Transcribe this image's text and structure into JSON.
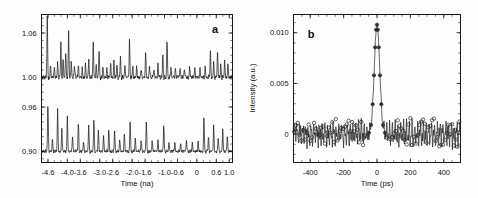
{
  "figure": {
    "panels": [
      {
        "letter": "a",
        "xlabel": "Time (na)",
        "ylabel": "",
        "xticks": [
          "-4.6",
          "-4.0",
          "-3.6",
          "-3.0",
          "-2.6",
          "-2.0",
          "-1.6",
          "-1.0",
          "-0.6",
          "0",
          "0.6",
          "1.0"
        ],
        "yticks": [
          "1.06",
          "1.00",
          "0.96",
          "0.90"
        ]
      },
      {
        "letter": "b",
        "xlabel": "Time (ps)",
        "ylabel": "Intensity (a.u.)",
        "xticks": [
          "-400",
          "-200",
          "0",
          "200",
          "400"
        ],
        "yticks": [
          "0.010",
          "0.005",
          "0"
        ]
      }
    ]
  },
  "chart_data": [
    {
      "type": "line",
      "panel": "a",
      "title": "",
      "xlabel": "Time (na)",
      "ylabel": "",
      "xlim": [
        -4.8,
        1.1
      ],
      "ylim": [
        0.885,
        1.085
      ],
      "xtick_values": [
        -4.6,
        -4.0,
        -3.6,
        -3.0,
        -2.6,
        -2.0,
        -1.6,
        -1.0,
        -0.6,
        0,
        0.6,
        1.0
      ],
      "ytick_values": [
        1.06,
        1.0,
        0.96,
        0.9
      ],
      "grid": false,
      "legend": "none",
      "series": [
        {
          "name": "upper-trace",
          "baseline": 1.0,
          "noise_amplitude": 0.004,
          "description": "Noisy baseline at 1.00 with sharp upward spikes",
          "peaks": [
            {
              "x": -4.62,
              "height": 0.082
            },
            {
              "x": -4.52,
              "height": 0.016
            },
            {
              "x": -4.4,
              "height": 0.012
            },
            {
              "x": -4.3,
              "height": 0.02
            },
            {
              "x": -4.2,
              "height": 0.047
            },
            {
              "x": -4.13,
              "height": 0.024
            },
            {
              "x": -4.05,
              "height": 0.037
            },
            {
              "x": -3.96,
              "height": 0.062
            },
            {
              "x": -3.88,
              "height": 0.023
            },
            {
              "x": -3.78,
              "height": 0.016
            },
            {
              "x": -3.66,
              "height": 0.018
            },
            {
              "x": -3.54,
              "height": 0.013
            },
            {
              "x": -3.44,
              "height": 0.02
            },
            {
              "x": -3.34,
              "height": 0.026
            },
            {
              "x": -3.2,
              "height": 0.048
            },
            {
              "x": -3.11,
              "height": 0.017
            },
            {
              "x": -3.02,
              "height": 0.036
            },
            {
              "x": -2.9,
              "height": 0.014
            },
            {
              "x": -2.78,
              "height": 0.012
            },
            {
              "x": -2.66,
              "height": 0.019
            },
            {
              "x": -2.56,
              "height": 0.024
            },
            {
              "x": -2.47,
              "height": 0.018
            },
            {
              "x": -2.36,
              "height": 0.028
            },
            {
              "x": -2.22,
              "height": 0.015
            },
            {
              "x": -2.08,
              "height": 0.052
            },
            {
              "x": -1.98,
              "height": 0.017
            },
            {
              "x": -1.86,
              "height": 0.014
            },
            {
              "x": -1.72,
              "height": 0.011
            },
            {
              "x": -1.58,
              "height": 0.035
            },
            {
              "x": -1.46,
              "height": 0.016
            },
            {
              "x": -1.33,
              "height": 0.012
            },
            {
              "x": -1.2,
              "height": 0.022
            },
            {
              "x": -1.05,
              "height": 0.03
            },
            {
              "x": -0.92,
              "height": 0.054
            },
            {
              "x": -0.8,
              "height": 0.014
            },
            {
              "x": -0.66,
              "height": 0.011
            },
            {
              "x": -0.52,
              "height": 0.013
            },
            {
              "x": -0.38,
              "height": 0.012
            },
            {
              "x": -0.22,
              "height": 0.015
            },
            {
              "x": -0.06,
              "height": 0.013
            },
            {
              "x": 0.1,
              "height": 0.012
            },
            {
              "x": 0.26,
              "height": 0.014
            },
            {
              "x": 0.42,
              "height": 0.036
            },
            {
              "x": 0.52,
              "height": 0.02
            },
            {
              "x": 0.64,
              "height": 0.038
            },
            {
              "x": 0.74,
              "height": 0.018
            },
            {
              "x": 0.86,
              "height": 0.024
            },
            {
              "x": 0.96,
              "height": 0.02
            }
          ]
        },
        {
          "name": "lower-trace",
          "baseline": 0.9,
          "noise_amplitude": 0.003,
          "description": "Noisy baseline at 0.90 with regularly spaced taller spikes",
          "peaks": [
            {
              "x": -4.6,
              "height": 0.068
            },
            {
              "x": -4.46,
              "height": 0.018
            },
            {
              "x": -4.3,
              "height": 0.058
            },
            {
              "x": -4.17,
              "height": 0.032
            },
            {
              "x": -4.0,
              "height": 0.049
            },
            {
              "x": -3.84,
              "height": 0.021
            },
            {
              "x": -3.66,
              "height": 0.044
            },
            {
              "x": -3.5,
              "height": 0.014
            },
            {
              "x": -3.34,
              "height": 0.036
            },
            {
              "x": -3.18,
              "height": 0.046
            },
            {
              "x": -3.04,
              "height": 0.03
            },
            {
              "x": -2.88,
              "height": 0.022
            },
            {
              "x": -2.72,
              "height": 0.033
            },
            {
              "x": -2.54,
              "height": 0.029
            },
            {
              "x": -2.38,
              "height": 0.016
            },
            {
              "x": -2.24,
              "height": 0.026
            },
            {
              "x": -2.06,
              "height": 0.047
            },
            {
              "x": -1.9,
              "height": 0.02
            },
            {
              "x": -1.72,
              "height": 0.016
            },
            {
              "x": -1.56,
              "height": 0.042
            },
            {
              "x": -1.38,
              "height": 0.015
            },
            {
              "x": -1.2,
              "height": 0.018
            },
            {
              "x": -1.02,
              "height": 0.04
            },
            {
              "x": -0.86,
              "height": 0.014
            },
            {
              "x": -0.68,
              "height": 0.013
            },
            {
              "x": -0.5,
              "height": 0.012
            },
            {
              "x": -0.32,
              "height": 0.016
            },
            {
              "x": -0.14,
              "height": 0.012
            },
            {
              "x": 0.04,
              "height": 0.015
            },
            {
              "x": 0.22,
              "height": 0.048
            },
            {
              "x": 0.36,
              "height": 0.02
            },
            {
              "x": 0.52,
              "height": 0.035
            },
            {
              "x": 0.66,
              "height": 0.018
            },
            {
              "x": 0.8,
              "height": 0.03
            },
            {
              "x": 0.94,
              "height": 0.022
            }
          ]
        }
      ]
    },
    {
      "type": "scatter",
      "panel": "b",
      "title": "",
      "xlabel": "Time (ps)",
      "ylabel": "Intensity (a.u.)",
      "xlim": [
        -500,
        500
      ],
      "ylim": [
        -0.0028,
        0.0118
      ],
      "xtick_values": [
        -400,
        -200,
        0,
        200,
        400
      ],
      "ytick_values": [
        0.01,
        0.005,
        0
      ],
      "grid": false,
      "legend": "none",
      "peak": {
        "center_ps": 0,
        "amplitude": 0.0108,
        "fwhm_ps": 38
      },
      "noise_amplitude": 0.0011,
      "series": [
        {
          "name": "autocorrelation-fit",
          "style": "line"
        },
        {
          "name": "measured-points",
          "style": "open-circles"
        },
        {
          "name": "peak-points",
          "style": "filled-circles"
        }
      ]
    }
  ]
}
